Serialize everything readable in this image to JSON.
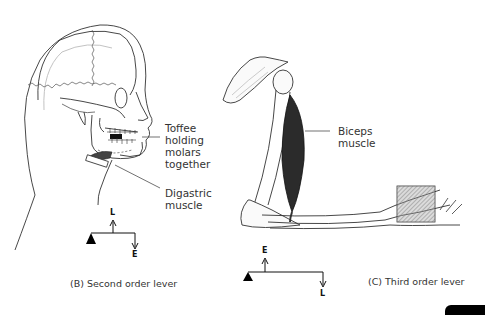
{
  "figure": {
    "panel_b": {
      "caption": "(B) Second order lever",
      "labels": {
        "toffee": [
          "Toffee",
          "holding",
          "molars",
          "together"
        ],
        "digastric": [
          "Digastric",
          "muscle"
        ]
      },
      "lever": {
        "top_letter": "L",
        "bottom_letter": "E"
      }
    },
    "panel_c": {
      "caption": "(C) Third order lever",
      "labels": {
        "biceps": [
          "Biceps",
          "muscle"
        ]
      },
      "lever": {
        "top_letter": "E",
        "bottom_letter": "L"
      }
    }
  }
}
